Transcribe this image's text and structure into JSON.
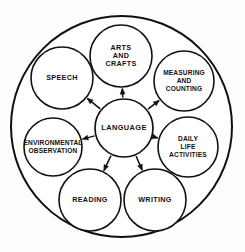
{
  "diagram": {
    "type": "hub-and-spoke-circular",
    "title": "",
    "background_color": "#fdfdfb",
    "line_color": "#111111",
    "hub": {
      "id": "language",
      "label": "LANGUAGE",
      "lines": [
        "LANGUAGE"
      ],
      "cx": 124,
      "cy": 128,
      "r": 29
    },
    "outer_ring": {
      "name": "outer-boundary-circle",
      "cx": 121.5,
      "cy": 126.5,
      "r": 110.5
    },
    "nodes": [
      {
        "id": "arts-and-crafts",
        "label": "ARTS AND CRAFTS",
        "lines": [
          "ARTS",
          "AND",
          "CRAFTS"
        ],
        "cx": 121,
        "cy": 56,
        "r": 31,
        "wide": false
      },
      {
        "id": "measuring-and-counting",
        "label": "MEASURING AND COUNTING",
        "lines": [
          "MEASURING",
          "AND",
          "COUNTING"
        ],
        "cx": 184,
        "cy": 81,
        "r": 30,
        "wide": true
      },
      {
        "id": "daily-life-activities",
        "label": "DAILY LIFE ACTIVITIES",
        "lines": [
          "DAILY",
          "LIFE",
          "ACTIVITIES"
        ],
        "cx": 188,
        "cy": 147,
        "r": 30,
        "wide": true
      },
      {
        "id": "writing",
        "label": "WRITING",
        "lines": [
          "WRITING"
        ],
        "cx": 155,
        "cy": 200,
        "r": 31,
        "wide": false
      },
      {
        "id": "reading",
        "label": "READING",
        "lines": [
          "READING"
        ],
        "cx": 90,
        "cy": 200,
        "r": 31,
        "wide": false
      },
      {
        "id": "environmental-observation",
        "label": "ENVIRONMENTAL OBSERVATION",
        "lines": [
          "ENVIRONMENTAL",
          "OBSERVATION"
        ],
        "cx": 53,
        "cy": 147,
        "r": 29,
        "wide": true
      },
      {
        "id": "speech",
        "label": "SPEECH",
        "lines": [
          "SPEECH"
        ],
        "cx": 62,
        "cy": 78,
        "r": 31,
        "wide": false
      }
    ],
    "connections": [
      {
        "from": "language",
        "to": "arts-and-crafts",
        "arrow": "to"
      },
      {
        "from": "language",
        "to": "measuring-and-counting",
        "arrow": "to"
      },
      {
        "from": "language",
        "to": "daily-life-activities",
        "arrow": "to"
      },
      {
        "from": "language",
        "to": "writing",
        "arrow": "to"
      },
      {
        "from": "language",
        "to": "reading",
        "arrow": "to"
      },
      {
        "from": "language",
        "to": "environmental-observation",
        "arrow": "to"
      },
      {
        "from": "language",
        "to": "speech",
        "arrow": "to"
      }
    ]
  }
}
